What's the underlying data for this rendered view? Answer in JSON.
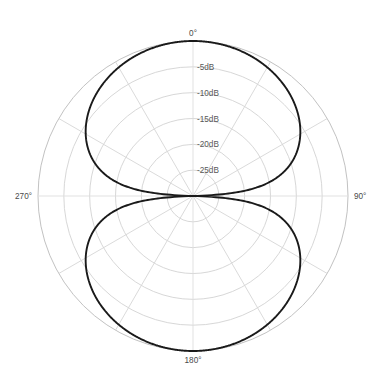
{
  "chart_data": {
    "type": "line",
    "subtype": "polar",
    "title": "",
    "subtitle": "",
    "xlabel": "",
    "ylabel": "",
    "grid": true,
    "legend": null,
    "legend_position": "none",
    "pattern_name": "figure-8 bidirectional polar pattern",
    "theta_label_unit": "degrees",
    "r_label_unit": "dB",
    "rlim": [
      -30,
      0
    ],
    "r_outer_db": 0,
    "r_center_db": -30,
    "thetalim": [
      0,
      360
    ],
    "theta_zero_location": "N",
    "theta_direction": "clockwise",
    "angle_tick_labels": [
      "0°",
      "90°",
      "180°",
      "270°"
    ],
    "angle_tick_values": [
      0,
      90,
      180,
      270
    ],
    "angle_grid_step_degrees": 30,
    "radial_tick_labels": [
      "-5dB",
      "-10dB",
      "-15dB",
      "-20dB",
      "-25dB"
    ],
    "radial_tick_values": [
      -5,
      -10,
      -15,
      -20,
      -25
    ],
    "radial_grid_values": [
      -5,
      -10,
      -15,
      -20,
      -25,
      -30
    ],
    "radial_label_angle_degrees": 0,
    "curve_color": "#1a1a1a",
    "grid_color": "#d2d2d2",
    "background_color": "#ffffff",
    "series": [
      {
        "name": "directivity",
        "formula_db": "20*log10(|cos(theta)|)",
        "theta": [
          0,
          10,
          20,
          30,
          40,
          50,
          60,
          70,
          75,
          80,
          85,
          88,
          90,
          92,
          95,
          100,
          105,
          110,
          120,
          130,
          140,
          150,
          160,
          170,
          180,
          190,
          200,
          210,
          220,
          230,
          240,
          250,
          260,
          265,
          268,
          270,
          272,
          275,
          280,
          285,
          290,
          300,
          310,
          320,
          330,
          340,
          350,
          360
        ],
        "values_db": [
          0,
          -0.13,
          -0.54,
          -1.25,
          -2.31,
          -3.83,
          -6.02,
          -9.3,
          -11.74,
          -15.19,
          -21.19,
          -29.55,
          -30,
          -29.55,
          -21.19,
          -15.19,
          -11.74,
          -9.3,
          -6.02,
          -3.83,
          -2.31,
          -1.25,
          -0.54,
          -0.13,
          0,
          -0.13,
          -0.54,
          -1.25,
          -2.31,
          -3.83,
          -6.02,
          -9.3,
          -15.19,
          -21.19,
          -29.55,
          -30,
          -29.55,
          -21.19,
          -15.19,
          -11.74,
          -9.3,
          -6.02,
          -3.83,
          -2.31,
          -1.25,
          -0.54,
          -0.13,
          0
        ]
      }
    ]
  },
  "labels": {
    "angle_0": "0°",
    "angle_90": "90°",
    "angle_180": "180°",
    "angle_270": "270°",
    "radial_5": "-5dB",
    "radial_10": "-10dB",
    "radial_15": "-15dB",
    "radial_20": "-20dB",
    "radial_25": "-25dB"
  }
}
